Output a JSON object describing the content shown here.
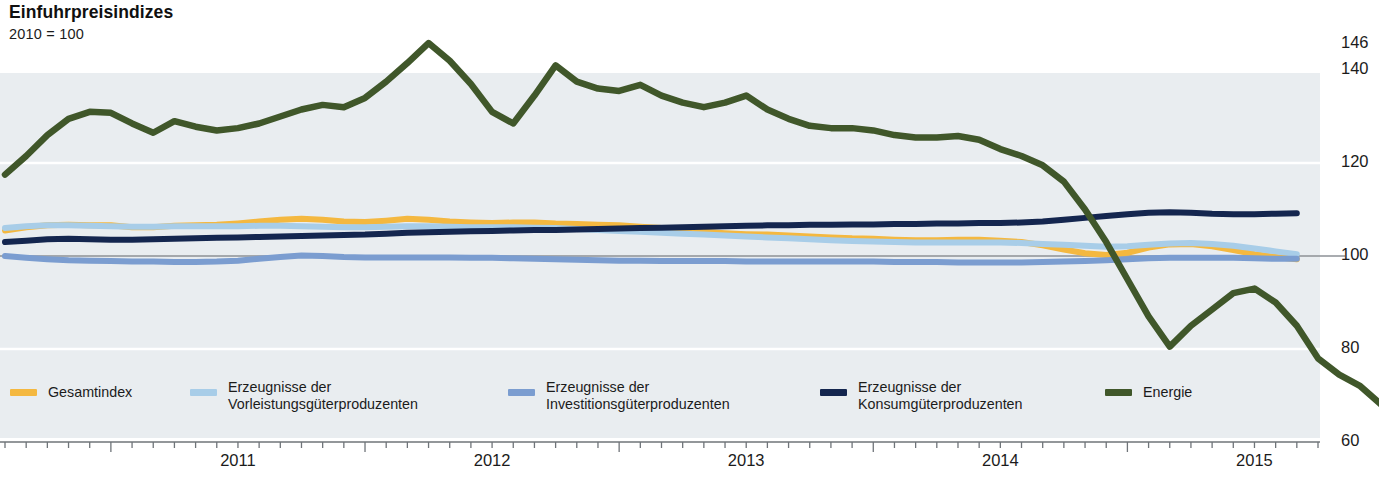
{
  "header": {
    "title": "Einfuhrpreisindizes",
    "subtitle": "2010 = 100"
  },
  "legend": {
    "items": [
      {
        "label": "Gesamtindex",
        "color": "#f4b840",
        "lines": 1,
        "x": 10
      },
      {
        "label": "Erzeugnisse der\nVorleistungsgüterproduzenten",
        "color": "#a8cde8",
        "lines": 2,
        "x": 190
      },
      {
        "label": "Erzeugnisse der\nInvestitionsgüterproduzenten",
        "color": "#7b9dd0",
        "lines": 2,
        "x": 508
      },
      {
        "label": "Erzeugnisse der\nKonsumgüterproduzenten",
        "color": "#14264f",
        "lines": 2,
        "x": 820
      },
      {
        "label": "Energie",
        "color": "#40572a",
        "lines": 1,
        "x": 1105
      }
    ]
  },
  "chart_data": {
    "type": "line",
    "title": "Einfuhrpreisindizes",
    "subtitle": "2010 = 100",
    "xlabel": "",
    "ylabel": "",
    "ylim": [
      60,
      146
    ],
    "yticks": [
      60,
      80,
      100,
      120,
      140,
      146
    ],
    "grid": true,
    "grid_color": "#ffffff",
    "plot_background": "#e9edf0",
    "legend_position": "bottom",
    "x_axis_type": "monthly",
    "x_range": [
      "2010-08",
      "2015-10"
    ],
    "xticks": [
      {
        "label": "2011",
        "value": "2011-07"
      },
      {
        "label": "2012",
        "value": "2012-07"
      },
      {
        "label": "2013",
        "value": "2013-07"
      },
      {
        "label": "2014",
        "value": "2014-07"
      },
      {
        "label": "2015",
        "value": "2015-07"
      }
    ],
    "x_months": [
      "2010-08",
      "2010-09",
      "2010-10",
      "2010-11",
      "2010-12",
      "2011-01",
      "2011-02",
      "2011-03",
      "2011-04",
      "2011-05",
      "2011-06",
      "2011-07",
      "2011-08",
      "2011-09",
      "2011-10",
      "2011-11",
      "2011-12",
      "2012-01",
      "2012-02",
      "2012-03",
      "2012-04",
      "2012-05",
      "2012-06",
      "2012-07",
      "2012-08",
      "2012-09",
      "2012-10",
      "2012-11",
      "2012-12",
      "2013-01",
      "2013-02",
      "2013-03",
      "2013-04",
      "2013-05",
      "2013-06",
      "2013-07",
      "2013-08",
      "2013-09",
      "2013-10",
      "2013-11",
      "2013-12",
      "2014-01",
      "2014-02",
      "2014-03",
      "2014-04",
      "2014-05",
      "2014-06",
      "2014-07",
      "2014-08",
      "2014-09",
      "2014-10",
      "2014-11",
      "2014-12",
      "2015-01",
      "2015-02",
      "2015-03",
      "2015-04",
      "2015-05",
      "2015-06",
      "2015-07",
      "2015-08",
      "2015-09",
      "2015-10"
    ],
    "series": [
      {
        "name": "Gesamtindex",
        "color": "#f4b840",
        "values": [
          105.5,
          106.2,
          106.6,
          106.7,
          106.6,
          106.6,
          106.2,
          106.2,
          106.5,
          106.6,
          106.7,
          107.0,
          107.4,
          107.8,
          108.0,
          107.8,
          107.4,
          107.3,
          107.6,
          108.0,
          107.8,
          107.4,
          107.2,
          107.1,
          107.2,
          107.2,
          107.0,
          106.9,
          106.7,
          106.6,
          106.3,
          106.0,
          105.6,
          105.2,
          104.9,
          104.7,
          104.6,
          104.4,
          104.2,
          104.0,
          103.8,
          103.7,
          103.5,
          103.4,
          103.4,
          103.5,
          103.5,
          103.3,
          103.0,
          102.3,
          101.4,
          100.6,
          100.2,
          100.7,
          101.8,
          102.5,
          102.6,
          102.1,
          101.3,
          100.4,
          99.8,
          99.3
        ]
      },
      {
        "name": "Erzeugnisse der Vorleistungsgüterproduzenten",
        "color": "#a8cde8",
        "values": [
          106.0,
          106.4,
          106.6,
          106.6,
          106.5,
          106.4,
          106.3,
          106.3,
          106.4,
          106.4,
          106.4,
          106.4,
          106.5,
          106.5,
          106.4,
          106.3,
          106.2,
          106.2,
          106.3,
          106.4,
          106.4,
          106.3,
          106.2,
          106.2,
          106.2,
          106.1,
          106.0,
          105.8,
          105.6,
          105.4,
          105.2,
          105.0,
          104.8,
          104.6,
          104.4,
          104.2,
          104.0,
          103.8,
          103.6,
          103.4,
          103.2,
          103.1,
          103.0,
          102.9,
          102.9,
          102.9,
          102.9,
          102.9,
          102.8,
          102.6,
          102.4,
          102.2,
          102.0,
          102.1,
          102.4,
          102.7,
          102.8,
          102.6,
          102.2,
          101.6,
          101.0,
          100.4
        ]
      },
      {
        "name": "Erzeugnisse der Investitionsgüterproduzenten",
        "color": "#7b9dd0",
        "values": [
          100.0,
          99.6,
          99.3,
          99.1,
          99.0,
          98.9,
          98.8,
          98.8,
          98.7,
          98.7,
          98.8,
          99.0,
          99.4,
          99.8,
          100.1,
          100.0,
          99.8,
          99.7,
          99.7,
          99.7,
          99.7,
          99.7,
          99.6,
          99.6,
          99.5,
          99.4,
          99.3,
          99.2,
          99.1,
          99.0,
          99.0,
          98.9,
          98.9,
          98.9,
          98.9,
          98.8,
          98.8,
          98.8,
          98.8,
          98.8,
          98.8,
          98.8,
          98.7,
          98.7,
          98.7,
          98.6,
          98.6,
          98.6,
          98.6,
          98.7,
          98.8,
          98.9,
          99.1,
          99.3,
          99.5,
          99.6,
          99.6,
          99.6,
          99.6,
          99.5,
          99.4,
          99.4
        ]
      },
      {
        "name": "Erzeugnisse der Konsumgüterproduzenten",
        "color": "#14264f",
        "values": [
          103.0,
          103.3,
          103.6,
          103.7,
          103.6,
          103.5,
          103.5,
          103.6,
          103.7,
          103.8,
          103.9,
          104.0,
          104.1,
          104.2,
          104.3,
          104.4,
          104.5,
          104.6,
          104.8,
          105.0,
          105.1,
          105.2,
          105.3,
          105.4,
          105.5,
          105.6,
          105.6,
          105.7,
          105.8,
          105.9,
          106.0,
          106.1,
          106.2,
          106.3,
          106.4,
          106.5,
          106.6,
          106.6,
          106.7,
          106.7,
          106.8,
          106.8,
          106.9,
          106.9,
          107.0,
          107.0,
          107.1,
          107.1,
          107.2,
          107.4,
          107.8,
          108.2,
          108.6,
          109.0,
          109.3,
          109.4,
          109.3,
          109.1,
          109.0,
          109.0,
          109.1,
          109.2
        ]
      },
      {
        "name": "Energie",
        "color": "#40572a",
        "values": [
          117.5,
          121.5,
          126.0,
          129.5,
          131.0,
          130.8,
          128.5,
          126.5,
          129.0,
          127.8,
          127.0,
          127.5,
          128.5,
          130.0,
          131.5,
          132.5,
          132.0,
          134.0,
          137.5,
          141.5,
          145.8,
          142.0,
          137.0,
          131.0,
          128.5,
          134.5,
          141.0,
          137.5,
          136.0,
          135.5,
          136.8,
          134.5,
          133.0,
          132.0,
          133.0,
          134.5,
          131.5,
          129.5,
          128.0,
          127.5,
          127.5,
          127.0,
          126.0,
          125.5,
          125.5,
          125.8,
          125.0,
          123.0,
          121.5,
          119.5,
          116.0,
          110.0,
          103.0,
          95.0,
          87.0,
          80.5,
          85.0,
          88.5,
          92.0,
          93.0,
          90.0,
          85.0,
          78.0,
          74.5,
          72.0,
          68.0
        ]
      }
    ]
  }
}
